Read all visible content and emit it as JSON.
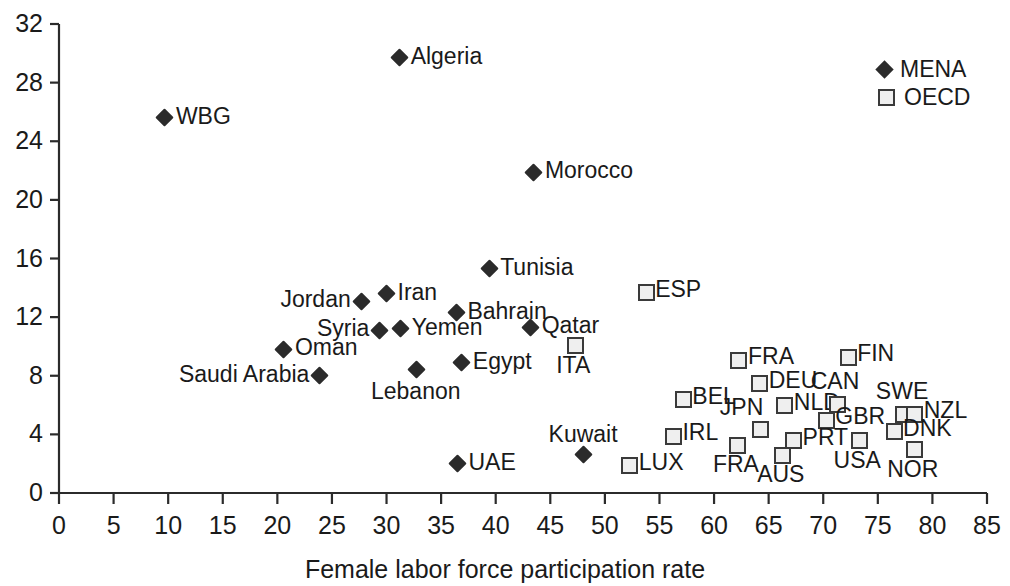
{
  "chart_data": {
    "type": "scatter",
    "title": "",
    "xlabel": "Female labor force participation rate",
    "ylabel": "",
    "xlim": [
      0,
      85
    ],
    "ylim": [
      0,
      32
    ],
    "xticks": [
      0,
      5,
      10,
      15,
      20,
      25,
      30,
      35,
      40,
      45,
      50,
      55,
      60,
      65,
      70,
      75,
      80,
      85
    ],
    "yticks": [
      0,
      4,
      8,
      12,
      16,
      20,
      24,
      28,
      32
    ],
    "grid": false,
    "legend_position": "top-right",
    "legend": [
      {
        "name": "MENA",
        "marker": "filled-diamond",
        "color": "#2b2b2b"
      },
      {
        "name": "OECD",
        "marker": "open-square",
        "color": "#3a3a3a"
      }
    ],
    "series": [
      {
        "name": "MENA",
        "marker": "filled-diamond",
        "color": "#2b2b2b",
        "points": [
          {
            "label": "WBG",
            "x": 9.7,
            "y": 25.6,
            "label_pos": "right"
          },
          {
            "label": "Algeria",
            "x": 31.2,
            "y": 29.7,
            "label_pos": "right"
          },
          {
            "label": "Morocco",
            "x": 43.5,
            "y": 21.9,
            "label_pos": "right"
          },
          {
            "label": "Tunisia",
            "x": 39.4,
            "y": 15.3,
            "label_pos": "right"
          },
          {
            "label": "Iran",
            "x": 30.0,
            "y": 13.6,
            "label_pos": "right"
          },
          {
            "label": "Jordan",
            "x": 27.7,
            "y": 13.1,
            "label_pos": "left"
          },
          {
            "label": "Bahrain",
            "x": 36.4,
            "y": 12.3,
            "label_pos": "right"
          },
          {
            "label": "Syria",
            "x": 29.4,
            "y": 11.1,
            "label_pos": "left"
          },
          {
            "label": "Yemen",
            "x": 31.3,
            "y": 11.2,
            "label_pos": "right"
          },
          {
            "label": "Qatar",
            "x": 43.2,
            "y": 11.3,
            "label_pos": "right"
          },
          {
            "label": "Oman",
            "x": 20.6,
            "y": 9.8,
            "label_pos": "right"
          },
          {
            "label": "Egypt",
            "x": 36.9,
            "y": 8.9,
            "label_pos": "right"
          },
          {
            "label": "Lebanon",
            "x": 32.7,
            "y": 8.4,
            "label_pos": "below"
          },
          {
            "label": "Saudi Arabia",
            "x": 23.9,
            "y": 8.0,
            "label_pos": "left"
          },
          {
            "label": "Kuwait",
            "x": 48.0,
            "y": 2.6,
            "label_pos": "above"
          },
          {
            "label": "UAE",
            "x": 36.5,
            "y": 2.0,
            "label_pos": "right"
          }
        ]
      },
      {
        "name": "OECD",
        "marker": "open-square",
        "color": "#3a3a3a",
        "points": [
          {
            "label": "ESP",
            "x": 53.6,
            "y": 13.8,
            "label_pos": "right"
          },
          {
            "label": "ITA",
            "x": 47.1,
            "y": 10.2,
            "label_pos": "below"
          },
          {
            "label": "FRA",
            "x": 62.1,
            "y": 9.2,
            "label_pos": "right"
          },
          {
            "label": "FIN",
            "x": 72.1,
            "y": 9.4,
            "label_pos": "right"
          },
          {
            "label": "DEU",
            "x": 64.0,
            "y": 7.6,
            "label_pos": "right"
          },
          {
            "label": "BEL",
            "x": 57.0,
            "y": 6.5,
            "label_pos": "right"
          },
          {
            "label": "NLD",
            "x": 66.3,
            "y": 6.1,
            "label_pos": "right"
          },
          {
            "label": "CAN",
            "x": 71.1,
            "y": 6.2,
            "label_pos": "above"
          },
          {
            "label": "SWE",
            "x": 77.2,
            "y": 5.5,
            "label_pos": "above"
          },
          {
            "label": "NZL",
            "x": 78.2,
            "y": 5.5,
            "label_pos": "right"
          },
          {
            "label": "GBR",
            "x": 70.1,
            "y": 5.1,
            "label_pos": "right"
          },
          {
            "label": "JPN",
            "x": 64.1,
            "y": 4.5,
            "label_pos": "above-left"
          },
          {
            "label": "DNK",
            "x": 76.3,
            "y": 4.3,
            "label_pos": "right"
          },
          {
            "label": "IRL",
            "x": 56.1,
            "y": 4.0,
            "label_pos": "right"
          },
          {
            "label": "PRT",
            "x": 67.1,
            "y": 3.7,
            "label_pos": "right"
          },
          {
            "label": "FRA",
            "x": 62.0,
            "y": 3.4,
            "label_pos": "below"
          },
          {
            "label": "USA",
            "x": 73.1,
            "y": 3.7,
            "label_pos": "below"
          },
          {
            "label": "AUS",
            "x": 66.1,
            "y": 2.7,
            "label_pos": "below"
          },
          {
            "label": "NOR",
            "x": 78.2,
            "y": 3.1,
            "label_pos": "below"
          },
          {
            "label": "LUX",
            "x": 52.1,
            "y": 2.0,
            "label_pos": "right"
          }
        ]
      }
    ]
  }
}
